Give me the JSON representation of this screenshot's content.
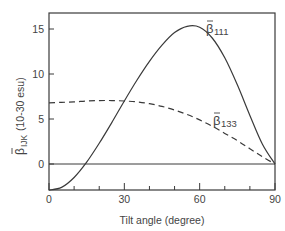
{
  "chart_data": {
    "type": "line",
    "title": "",
    "xlabel": "Tilt angle (degree)",
    "ylabel": "β̄IJK (10-30 esu)",
    "ylabel_main": "β̄",
    "ylabel_sub": "IJK",
    "ylabel_unit": " (10-30 esu)",
    "xlim": [
      0,
      90
    ],
    "ylim": [
      -2.9,
      16.7
    ],
    "x_ticks": [
      0,
      30,
      60,
      90
    ],
    "x_minor_ticks": [
      10,
      20,
      40,
      50,
      70,
      80
    ],
    "y_ticks": [
      0,
      5,
      10,
      15
    ],
    "grid": false,
    "zero_line": true,
    "series": [
      {
        "name": "β̄111",
        "label_main": "β̄",
        "label_sub": "111",
        "style": "solid",
        "x": [
          0,
          5,
          10,
          15,
          20,
          25,
          30,
          35,
          40,
          45,
          50,
          55,
          60,
          65,
          70,
          75,
          80,
          85,
          90
        ],
        "values": [
          -2.9,
          -2.6,
          -1.5,
          0.2,
          2.3,
          4.6,
          7.0,
          9.3,
          11.4,
          13.2,
          14.6,
          15.3,
          15.2,
          14.0,
          11.8,
          8.8,
          5.4,
          2.2,
          0.0
        ]
      },
      {
        "name": "β̄133",
        "label_main": "β̄",
        "label_sub": "133",
        "style": "dashed",
        "x": [
          0,
          5,
          10,
          15,
          20,
          25,
          30,
          35,
          40,
          45,
          50,
          55,
          60,
          65,
          70,
          75,
          80,
          85,
          90
        ],
        "values": [
          6.8,
          6.85,
          6.9,
          7.0,
          7.05,
          7.05,
          7.0,
          6.9,
          6.7,
          6.4,
          6.0,
          5.5,
          4.9,
          4.2,
          3.4,
          2.6,
          1.7,
          0.8,
          0.0
        ]
      }
    ]
  }
}
